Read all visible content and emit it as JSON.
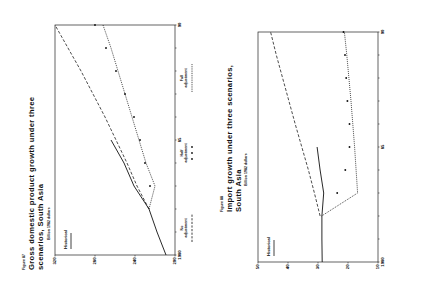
{
  "figures": [
    {
      "number": "Figure 87",
      "title_line1": "Gross domestic product growth under three",
      "title_line2": "scenarios, South Asia",
      "unit": "Billion 1982 dollars",
      "inline_label": "Historical"
    },
    {
      "number": "Figure 88",
      "title_line1": "Import growth under three scenarios,",
      "title_line2": "South Asia",
      "unit": "Billion 1982 dollars",
      "inline_label": "Historical"
    }
  ],
  "legend": {
    "no_adjustment_1": "No",
    "no_adjustment_2": "adjustment",
    "half_adjustment_1": "Half",
    "half_adjustment_2": "adjustment",
    "full_adjustment_1": "Full",
    "full_adjustment_2": "adjustment"
  },
  "chart_data": [
    {
      "type": "line",
      "title": "Gross domestic product growth under three scenarios, South Asia",
      "ylabel": "Billion 1982 dollars",
      "xlabel": "",
      "x": [
        1980,
        1981,
        1982,
        1983,
        1984,
        1985,
        1986,
        1987,
        1988,
        1989,
        1990
      ],
      "xticks": [
        "1980",
        "85",
        "90"
      ],
      "yticks": [
        320,
        280,
        240,
        200
      ],
      "ylim": [
        200,
        320
      ],
      "xlim": [
        1980,
        1990
      ],
      "grid": false,
      "legend_position": "bottom",
      "series": [
        {
          "name": "Historical",
          "style": "solid",
          "x": [
            1980,
            1981,
            1982,
            1983,
            1984,
            1985
          ],
          "values": [
            209,
            218,
            226,
            241,
            251,
            264
          ]
        },
        {
          "name": "No adjustment",
          "style": "dashed",
          "x": [
            1982,
            1983,
            1984,
            1985,
            1986,
            1987,
            1988,
            1989,
            1990
          ],
          "values": [
            226,
            238,
            248,
            259,
            270,
            282,
            294,
            307,
            320
          ]
        },
        {
          "name": "Half adjustment",
          "style": "stars",
          "x": [
            1983,
            1984,
            1985,
            1986,
            1987,
            1988,
            1989,
            1990
          ],
          "values": [
            225,
            230,
            235,
            241,
            250,
            259,
            269,
            280
          ]
        },
        {
          "name": "Full adjustment",
          "style": "dotted",
          "x": [
            1982,
            1983,
            1984,
            1985,
            1986,
            1987,
            1988,
            1989,
            1990
          ],
          "values": [
            226,
            220,
            229,
            236,
            243,
            250,
            257,
            264,
            272
          ]
        }
      ]
    },
    {
      "type": "line",
      "title": "Import growth under three scenarios, South Asia",
      "ylabel": "Billion 1982 dollars",
      "xlabel": "",
      "x": [
        1980,
        1981,
        1982,
        1983,
        1984,
        1985,
        1986,
        1987,
        1988,
        1989,
        1990
      ],
      "xticks": [
        "1980",
        "85",
        "90"
      ],
      "yticks": [
        50,
        40,
        30,
        20,
        10
      ],
      "ylim": [
        10,
        50
      ],
      "xlim": [
        1980,
        1990
      ],
      "grid": false,
      "legend_position": "bottom",
      "series": [
        {
          "name": "Historical",
          "style": "solid",
          "x": [
            1980,
            1981,
            1982,
            1983,
            1984,
            1985
          ],
          "values": [
            28.6,
            28.7,
            28.7,
            28.1,
            29.3,
            30.3
          ]
        },
        {
          "name": "No adjustment",
          "style": "dashed",
          "x": [
            1982,
            1983,
            1984,
            1985,
            1986,
            1987,
            1988,
            1989,
            1990
          ],
          "values": [
            29.3,
            31.2,
            33.2,
            35.4,
            37.6,
            39.7,
            41.8,
            43.9,
            45.8
          ]
        },
        {
          "name": "Half adjustment",
          "style": "stars",
          "x": [
            1983,
            1984,
            1985,
            1986,
            1987,
            1988,
            1989,
            1990
          ],
          "values": [
            23.6,
            20.9,
            19.5,
            19.5,
            20.2,
            20.6,
            21.0,
            21.5
          ]
        },
        {
          "name": "Full adjustment",
          "style": "dotted",
          "x": [
            1982,
            1983,
            1984,
            1985,
            1986,
            1987,
            1988,
            1989,
            1990
          ],
          "values": [
            28.8,
            16.8,
            17.3,
            17.8,
            18.4,
            19.0,
            19.7,
            20.4,
            21.2
          ]
        }
      ]
    }
  ]
}
